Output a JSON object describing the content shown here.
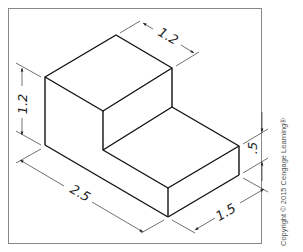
{
  "figure": {
    "type": "isometric-drawing",
    "object": "L-shaped step block",
    "line_color": "#111111",
    "dim_line_color": "#333333",
    "border_color": "#888888"
  },
  "dimensions": {
    "tall_height": "1.2",
    "top_depth": "1.2",
    "total_length": "2.5",
    "step_height": ".5",
    "depth": "1.5"
  },
  "copyright": "Copyright © 2015 Cengage Learning®"
}
